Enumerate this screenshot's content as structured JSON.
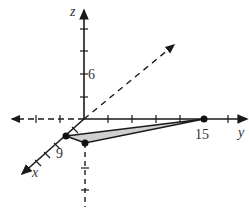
{
  "diagram": {
    "type": "3d-coordinate-axes",
    "axes": {
      "x_label": "x",
      "y_label": "y",
      "z_label": "z"
    },
    "tick_labels": {
      "z": "6",
      "x": "9",
      "y": "15"
    },
    "points": [
      {
        "name": "point-on-x-axis",
        "coords": "(9, 0, 0)"
      },
      {
        "name": "point-below-origin",
        "coords": "(x,y in xy-plane)"
      },
      {
        "name": "point-on-y-axis",
        "coords": "(0, 15, 0)"
      }
    ],
    "colors": {
      "axis": "#1a1a1a",
      "triangle_fill": "#d0d0d0",
      "label": "#333333"
    }
  }
}
